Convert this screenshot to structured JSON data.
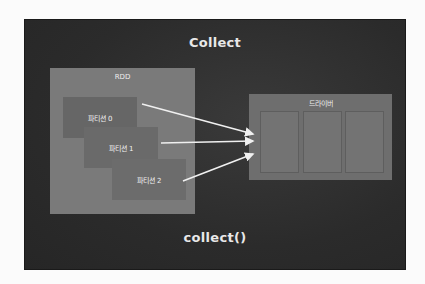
{
  "diagram": {
    "title": "Collect",
    "footer": "collect()",
    "rdd": {
      "label": "RDD",
      "partitions": [
        {
          "label": "파티션 0"
        },
        {
          "label": "파티션 1"
        },
        {
          "label": "파티션 2"
        }
      ]
    },
    "driver": {
      "label": "드라이버",
      "slots": 3
    },
    "arrows": [
      {
        "from": "파티션 0",
        "to": "드라이버"
      },
      {
        "from": "파티션 1",
        "to": "드라이버"
      },
      {
        "from": "파티션 2",
        "to": "드라이버"
      }
    ],
    "colors": {
      "background": "#2f2f2f",
      "rdd_box": "#7a7a7a",
      "partition_box": "#666666",
      "driver_box": "#6e6e6e",
      "arrow": "#f0f0f0",
      "text": "#e8e8e8"
    }
  }
}
